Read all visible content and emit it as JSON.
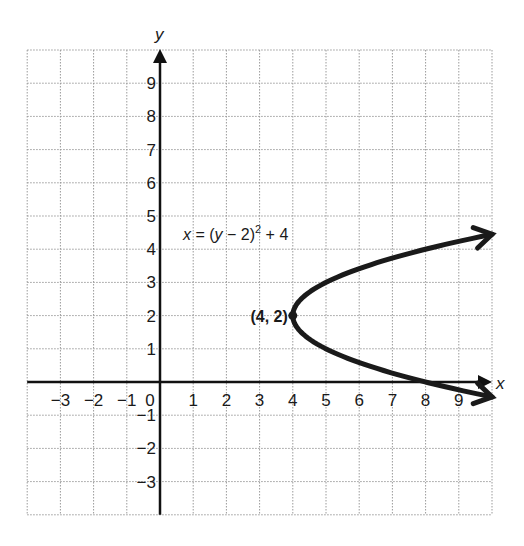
{
  "chart_data": {
    "type": "line",
    "title": "",
    "xlabel": "x",
    "ylabel": "y",
    "xlim": [
      -4,
      10
    ],
    "ylim": [
      -4,
      10
    ],
    "grid": true,
    "grid_style": "dotted",
    "x_ticks": [
      -3,
      -2,
      -1,
      0,
      1,
      2,
      3,
      4,
      5,
      6,
      7,
      8,
      9
    ],
    "x_tick_labels": [
      "−3",
      "−2",
      "−1",
      "0",
      "1",
      "2",
      "3",
      "4",
      "5",
      "6",
      "7",
      "8",
      "9"
    ],
    "y_ticks": [
      9,
      8,
      7,
      6,
      5,
      4,
      3,
      2,
      1,
      -1,
      -2,
      -3
    ],
    "y_tick_labels": [
      "9",
      "8",
      "7",
      "6",
      "5",
      "4",
      "3",
      "2",
      "1",
      "−1",
      "−2",
      "−3"
    ],
    "series": [
      {
        "name": "x = (y − 2)^2 + 4",
        "equation": "x = (y - 2)^2 + 4",
        "orientation": "horizontal-parabola",
        "y_range": [
          -0.45,
          4.45
        ],
        "color": "#1a1a1a",
        "arrows_at_ends": true,
        "sample_points": [
          {
            "x": 10.0,
            "y": -0.45
          },
          {
            "x": 8.0,
            "y": 0
          },
          {
            "x": 5.0,
            "y": 1
          },
          {
            "x": 4.0,
            "y": 2
          },
          {
            "x": 5.0,
            "y": 3
          },
          {
            "x": 8.0,
            "y": 4
          },
          {
            "x": 10.0,
            "y": 4.45
          }
        ]
      }
    ],
    "annotations": [
      {
        "text": "(4, 2)",
        "x": 4,
        "y": 2,
        "type": "vertex-point"
      },
      {
        "text": "x = (y − 2)² + 4",
        "x": 1,
        "y": 4.4,
        "type": "equation-label"
      }
    ]
  },
  "labels": {
    "x_axis": "x",
    "y_axis": "y",
    "vertex": "(4, 2)",
    "equation_lhs": "x",
    "equation_mid": " = (",
    "equation_var": "y",
    "equation_rest": " − 2)",
    "equation_exp": "2",
    "equation_tail": " + 4"
  },
  "colors": {
    "grid": "#9a9a9a",
    "axis": "#111111",
    "curve": "#1a1a1a",
    "background": "#ffffff"
  }
}
